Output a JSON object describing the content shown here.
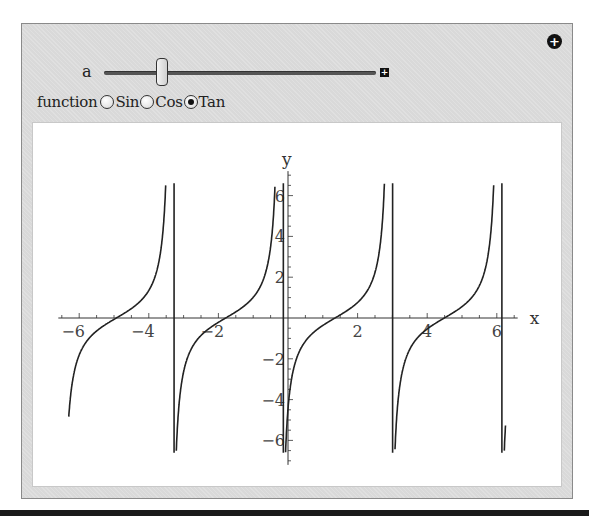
{
  "controls": {
    "slider": {
      "label": "a",
      "position_fraction": 0.2,
      "expand_icon": "plus-box-icon",
      "expand_glyph": "+"
    },
    "options_button": {
      "icon": "plus-circle-icon",
      "glyph": "+"
    },
    "function_selector": {
      "label": "function",
      "options": [
        {
          "label": "Sin",
          "selected": false
        },
        {
          "label": "Cos",
          "selected": false
        },
        {
          "label": "Tan",
          "selected": true
        }
      ]
    }
  },
  "chart_data": {
    "type": "line",
    "title": "",
    "function": "tan(x - 1.35)",
    "xlabel": "x",
    "ylabel": "y",
    "xlim": [
      -6.6,
      6.6
    ],
    "ylim": [
      -7.2,
      7.2
    ],
    "clip_y": [
      -6.6,
      6.6
    ],
    "x_ticks": [
      -6,
      -4,
      -2,
      2,
      4,
      6
    ],
    "x_tick_labels": [
      "−6",
      "−4",
      "−2",
      "2",
      "4",
      "6"
    ],
    "y_ticks": [
      -6,
      -4,
      -2,
      2,
      4,
      6
    ],
    "y_tick_labels": [
      "−6",
      "−4",
      "−2",
      "2",
      "4",
      "6"
    ],
    "phase_shift": 1.35,
    "zero_crossings": [
      -4.93,
      -1.79,
      1.35,
      4.49
    ],
    "asymptotes": [
      -3.36,
      -0.22,
      2.92,
      6.06
    ],
    "grid": false,
    "line_color": "#222222"
  }
}
